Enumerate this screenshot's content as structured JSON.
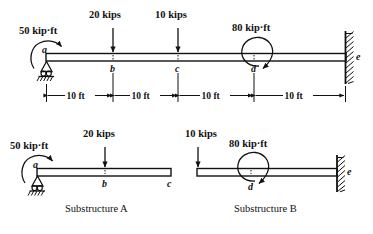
{
  "figure": {
    "title_present": false,
    "main_beam": {
      "name": "continuous-beam-abcde",
      "nodes": [
        {
          "label": "a",
          "support": "pin-roller",
          "x_ft": 0
        },
        {
          "label": "b",
          "support": "none",
          "x_ft": 10
        },
        {
          "label": "c",
          "support": "none",
          "x_ft": 20
        },
        {
          "label": "d",
          "support": "none",
          "x_ft": 30
        },
        {
          "label": "e",
          "support": "fixed-wall",
          "x_ft": 40
        }
      ],
      "loads": [
        {
          "type": "moment",
          "value": "50 kip·ft",
          "at": "a",
          "sense": "counterclockwise"
        },
        {
          "type": "point",
          "value": "20 kips",
          "at": "b",
          "direction": "down"
        },
        {
          "type": "point",
          "value": "10 kips",
          "at": "c",
          "direction": "down"
        },
        {
          "type": "moment",
          "value": "80 kip·ft",
          "at": "d",
          "sense": "clockwise"
        }
      ],
      "dimensions": [
        {
          "label": "10 ft",
          "from": "a",
          "to": "b"
        },
        {
          "label": "10 ft",
          "from": "b",
          "to": "c"
        },
        {
          "label": "10 ft",
          "from": "c",
          "to": "d"
        },
        {
          "label": "10 ft",
          "from": "d",
          "to": "e"
        }
      ]
    },
    "substructures": [
      {
        "caption": "Substructure A",
        "nodes": [
          {
            "label": "a",
            "support": "pin-roller"
          },
          {
            "label": "b",
            "support": "none"
          },
          {
            "label": "c",
            "support": "none"
          }
        ],
        "loads": [
          {
            "type": "moment",
            "value": "50 kip·ft",
            "at": "a",
            "sense": "counterclockwise"
          },
          {
            "type": "point",
            "value": "20 kips",
            "at": "b",
            "direction": "down"
          }
        ]
      },
      {
        "caption": "Substructure B",
        "nodes": [
          {
            "label": "d",
            "support": "none"
          },
          {
            "label": "e",
            "support": "fixed-wall"
          }
        ],
        "loads": [
          {
            "type": "point",
            "value": "10 kips",
            "at": "left-free-end",
            "direction": "down"
          },
          {
            "type": "moment",
            "value": "80 kip·ft",
            "at": "d",
            "sense": "clockwise"
          }
        ]
      }
    ]
  },
  "labels": {
    "moment_50": "50 kip·ft",
    "load_20": "20 kips",
    "load_10": "10 kips",
    "moment_80": "80 kip·ft",
    "node_a": "a",
    "node_b": "b",
    "node_c": "c",
    "node_d": "d",
    "node_e": "e",
    "dim_1": "10 ft",
    "dim_2": "10 ft",
    "dim_3": "10 ft",
    "dim_4": "10 ft",
    "sub_a_moment_50": "50 kip·ft",
    "sub_a_load_20": "20 kips",
    "sub_a_node_a": "a",
    "sub_a_node_b": "b",
    "sub_a_node_c": "c",
    "sub_b_load_10": "10 kips",
    "sub_b_moment_80": "80 kip·ft",
    "sub_b_node_d": "d",
    "sub_b_node_e": "e",
    "caption_a": "Substructure A",
    "caption_b": "Substructure B"
  },
  "colors": {
    "ink": "#111111",
    "paper": "#ffffff"
  }
}
